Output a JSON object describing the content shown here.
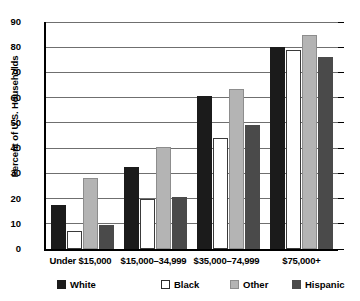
{
  "chart_data": {
    "type": "bar",
    "title": "",
    "xlabel": "",
    "ylabel": "Percent of U.S. Households",
    "ylim": [
      0,
      90
    ],
    "ytick_step": 10,
    "yticks": [
      "90",
      "80",
      "70",
      "60",
      "50",
      "40",
      "30",
      "20",
      "10",
      "0"
    ],
    "grid": true,
    "grid_axis": "y",
    "legend_position": "bottom",
    "categories": [
      "Under $15,000",
      "$15,000–34,999",
      "$35,000–74,999",
      "$75,000+"
    ],
    "series": [
      {
        "name": "White",
        "color": "#1b1b1b",
        "values": [
          17.5,
          32.5,
          60.5,
          80.0
        ]
      },
      {
        "name": "Black",
        "color": "#ffffff",
        "values": [
          7.0,
          20.0,
          44.0,
          79.0
        ]
      },
      {
        "name": "Other",
        "color": "#b4b4b4",
        "values": [
          28.0,
          40.5,
          63.5,
          85.0
        ]
      },
      {
        "name": "Hispanic",
        "color": "#4a4a4a",
        "values": [
          9.5,
          20.5,
          49.0,
          76.0
        ]
      }
    ]
  },
  "legend": {
    "items": [
      {
        "label": "White",
        "swatch": "white"
      },
      {
        "label": "Black",
        "swatch": "black"
      },
      {
        "label": "Other",
        "swatch": "other"
      },
      {
        "label": "Hispanic",
        "swatch": "hispanic"
      }
    ]
  },
  "source": {
    "text": ""
  }
}
